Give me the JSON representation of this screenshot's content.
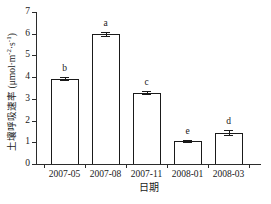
{
  "chart_data": {
    "type": "bar",
    "title": "",
    "subtitle": "",
    "xlabel": "日期",
    "ylabel": "土壤呼吸速率 (μmol·m⁻²·s⁻¹)",
    "ylabel_text": "土壤呼吸速率",
    "ylabel_units_prefix": " (μmol·m",
    "ylabel_units_exp1": "-2",
    "ylabel_units_mid": "·s",
    "ylabel_units_exp2": "-1",
    "ylabel_units_suffix": ")",
    "categories": [
      "2007-05",
      "2007-08",
      "2007-11",
      "2008-01",
      "2008-03"
    ],
    "values": [
      3.93,
      5.97,
      3.29,
      1.07,
      1.45
    ],
    "errors": [
      0.07,
      0.09,
      0.06,
      0.04,
      0.1
    ],
    "annotations": [
      "b",
      "a",
      "c",
      "e",
      "d"
    ],
    "ylim": [
      0,
      7
    ],
    "yticks": [
      0,
      1,
      2,
      3,
      4,
      5,
      6,
      7
    ],
    "ytick_labels": [
      "0",
      "1",
      "2",
      "3",
      "4",
      "5",
      "6",
      "7"
    ],
    "grid": false,
    "legend": false,
    "legend_position": "none",
    "bar_facecolor": "#ffffff",
    "bar_edgecolor": "#1a1a1a",
    "axis_color": "#2b2b2b"
  }
}
